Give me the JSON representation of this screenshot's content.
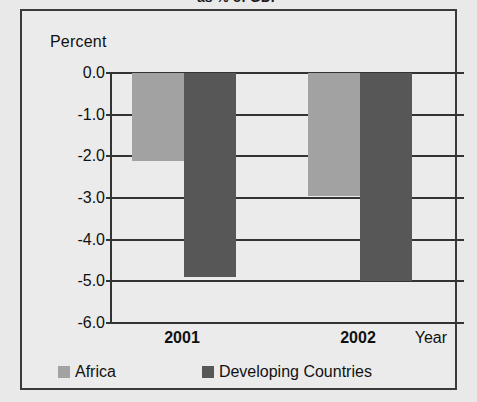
{
  "chart_data": {
    "type": "bar",
    "title": "as % of GDP",
    "xlabel": "Year",
    "ylabel": "Percent",
    "categories": [
      "2001",
      "2002"
    ],
    "series": [
      {
        "name": "Africa",
        "color": "#a2a2a2",
        "values": [
          -2.1,
          -2.95
        ]
      },
      {
        "name": "Developing Countries",
        "color": "#575757",
        "values": [
          -4.9,
          -5.0
        ]
      }
    ],
    "ylim": [
      -6.0,
      0.0
    ],
    "yticks": [
      "0.0",
      "-1.0",
      "-2.0",
      "-3.0",
      "-4.0",
      "-5.0",
      "-6.0"
    ],
    "ytick_values": [
      0.0,
      -1.0,
      -2.0,
      -3.0,
      -4.0,
      -5.0,
      -6.0
    ],
    "grid": true,
    "legend_position": "bottom"
  },
  "frame": {
    "border_color": "#3a3a3a",
    "background": "#ebebeb"
  }
}
